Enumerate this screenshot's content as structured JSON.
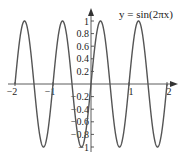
{
  "chart_data": {
    "type": "line",
    "title": "y = sin(2πx)",
    "xlabel": "",
    "ylabel": "",
    "xlim": [
      -2,
      2
    ],
    "ylim": [
      -1,
      1
    ],
    "grid": false,
    "x_ticks": [
      -2,
      -1,
      1,
      2
    ],
    "x_tick_labels": [
      "−2",
      "−1",
      "1",
      "2"
    ],
    "y_ticks": [
      1,
      0.8,
      0.6,
      0.4,
      0.2,
      -0.2,
      -0.4,
      -0.6,
      -0.8,
      -1
    ],
    "y_tick_labels": [
      "1",
      "0.8",
      "0.6",
      "0.4",
      "0.2",
      "−0.2",
      "−0.4",
      "−0.6",
      "−0.8",
      "−1"
    ],
    "series": [
      {
        "name": "sin(2πx)",
        "function": "sin(2*pi*x)",
        "domain": [
          -2,
          2
        ],
        "period": 1,
        "amplitude": 1
      }
    ]
  },
  "colors": {
    "curve": "#555555",
    "axis": "#333333"
  }
}
